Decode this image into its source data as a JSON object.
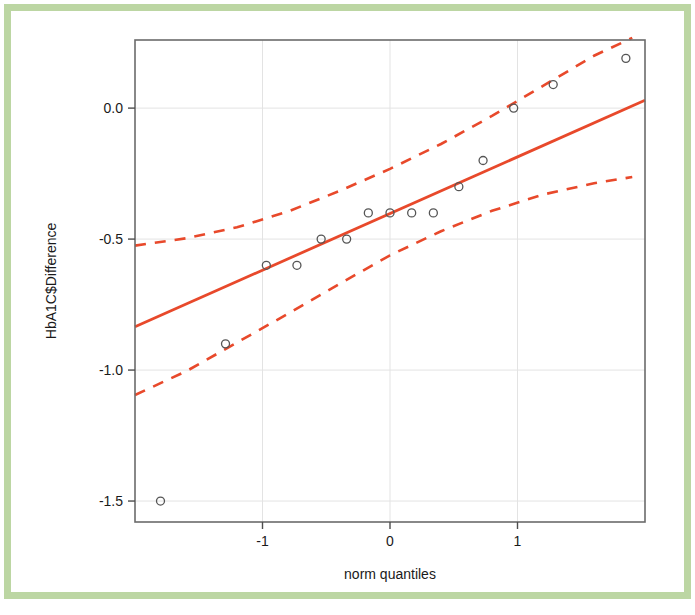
{
  "figure": {
    "border_color": "#bcd6a3",
    "background_color": "#ffffff"
  },
  "chart_data": {
    "type": "scatter",
    "title": "",
    "subtitle": "",
    "xlabel": "norm quantiles",
    "ylabel": "HbA1C$Difference",
    "xlim": [
      -2.0,
      2.0
    ],
    "ylim": [
      -1.58,
      0.26
    ],
    "grid": true,
    "legend": null,
    "xticks": [
      -1,
      0,
      1
    ],
    "xtick_labels": [
      "-1",
      "0",
      "1"
    ],
    "yticks": [
      0.0,
      -0.5,
      -1.0,
      -1.5
    ],
    "ytick_labels": [
      "0.0",
      "-0.5",
      "-1.0",
      "-1.5"
    ],
    "point_color": "#555555",
    "line_color": "#e8492b",
    "marker": "open-circle",
    "points": [
      {
        "x": -1.8,
        "y": -1.5
      },
      {
        "x": -1.29,
        "y": -0.9
      },
      {
        "x": -0.97,
        "y": -0.6
      },
      {
        "x": -0.73,
        "y": -0.6
      },
      {
        "x": -0.54,
        "y": -0.5
      },
      {
        "x": -0.34,
        "y": -0.5
      },
      {
        "x": -0.17,
        "y": -0.4
      },
      {
        "x": 0.0,
        "y": -0.4
      },
      {
        "x": 0.17,
        "y": -0.4
      },
      {
        "x": 0.34,
        "y": -0.4
      },
      {
        "x": 0.54,
        "y": -0.3
      },
      {
        "x": 0.73,
        "y": -0.2
      },
      {
        "x": 0.97,
        "y": 0.0
      },
      {
        "x": 1.28,
        "y": 0.09
      },
      {
        "x": 1.85,
        "y": 0.19
      }
    ],
    "reference_line": {
      "name": "qq reference line",
      "style": "solid",
      "color": "#e8492b",
      "x0": -2.0,
      "y0": -0.835,
      "x1": 2.0,
      "y1": 0.03
    },
    "confidence_bands": {
      "name": "pointwise 95% confidence envelope",
      "style": "dashed",
      "color": "#e8492b",
      "upper": [
        {
          "x": -2.0,
          "y": -0.525
        },
        {
          "x": -1.6,
          "y": -0.497
        },
        {
          "x": -1.2,
          "y": -0.455
        },
        {
          "x": -0.8,
          "y": -0.395
        },
        {
          "x": -0.4,
          "y": -0.317
        },
        {
          "x": 0.0,
          "y": -0.232
        },
        {
          "x": 0.4,
          "y": -0.137
        },
        {
          "x": 0.8,
          "y": -0.03
        },
        {
          "x": 1.2,
          "y": 0.085
        },
        {
          "x": 1.6,
          "y": 0.2
        },
        {
          "x": 1.9,
          "y": 0.268
        }
      ],
      "lower": [
        {
          "x": -2.0,
          "y": -1.095
        },
        {
          "x": -1.6,
          "y": -1.005
        },
        {
          "x": -1.2,
          "y": -0.895
        },
        {
          "x": -0.8,
          "y": -0.785
        },
        {
          "x": -0.4,
          "y": -0.672
        },
        {
          "x": 0.0,
          "y": -0.562
        },
        {
          "x": 0.4,
          "y": -0.47
        },
        {
          "x": 0.8,
          "y": -0.392
        },
        {
          "x": 1.2,
          "y": -0.33
        },
        {
          "x": 1.6,
          "y": -0.287
        },
        {
          "x": 1.9,
          "y": -0.263
        }
      ]
    }
  }
}
